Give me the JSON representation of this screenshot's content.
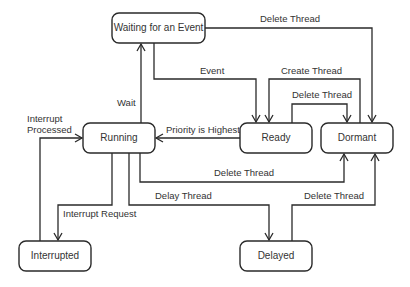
{
  "diagram": {
    "type": "state-diagram",
    "states": [
      {
        "id": "waiting",
        "label": "Waiting for an Event"
      },
      {
        "id": "running",
        "label": "Running"
      },
      {
        "id": "ready",
        "label": "Ready"
      },
      {
        "id": "dormant",
        "label": "Dormant"
      },
      {
        "id": "interrupted",
        "label": "Interrupted"
      },
      {
        "id": "delayed",
        "label": "Delayed"
      }
    ],
    "transitions": [
      {
        "from": "waiting",
        "to": "dormant",
        "label": "Delete Thread"
      },
      {
        "from": "waiting",
        "to": "ready",
        "label": "Event"
      },
      {
        "from": "dormant",
        "to": "ready",
        "label": "Create Thread"
      },
      {
        "from": "ready",
        "to": "dormant",
        "label": "Delete Thread"
      },
      {
        "from": "running",
        "to": "waiting",
        "label": "Wait"
      },
      {
        "from": "ready",
        "to": "running",
        "label": "Priority is Highest"
      },
      {
        "from": "interrupted",
        "to": "running",
        "label_lines": [
          "Interrupt",
          "Processed"
        ]
      },
      {
        "from": "running",
        "to": "dormant",
        "label": "Delete Thread"
      },
      {
        "from": "running",
        "to": "interrupted",
        "label": "Interrupt Request"
      },
      {
        "from": "running",
        "to": "delayed",
        "label": "Delay Thread"
      },
      {
        "from": "delayed",
        "to": "dormant",
        "label": "Delete Thread"
      }
    ]
  }
}
